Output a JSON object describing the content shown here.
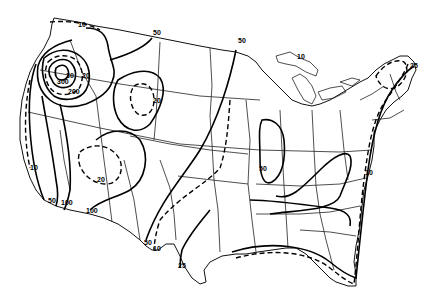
{
  "map": {
    "type": "isoline map",
    "region": "Contiguous United States",
    "line_styles": [
      "solid",
      "dashed"
    ],
    "contour_labels": [
      {
        "id": "nw-10",
        "text": "10",
        "x": 78,
        "y": 27
      },
      {
        "id": "nw-30",
        "text": "30",
        "x": 66,
        "y": 78
      },
      {
        "id": "nw-20",
        "text": "20",
        "x": 82,
        "y": 78
      },
      {
        "id": "nw-300",
        "text": "300",
        "x": 57,
        "y": 84
      },
      {
        "id": "nw-200",
        "text": "200",
        "x": 68,
        "y": 94
      },
      {
        "id": "north-50",
        "text": "50",
        "x": 153,
        "y": 35
      },
      {
        "id": "plains-50",
        "text": "50",
        "x": 238,
        "y": 43
      },
      {
        "id": "great-basin-20",
        "text": "20",
        "x": 153,
        "y": 103
      },
      {
        "id": "west-coast-10",
        "text": "10",
        "x": 30,
        "y": 170
      },
      {
        "id": "sw-20",
        "text": "20",
        "x": 97,
        "y": 182
      },
      {
        "id": "west-coast-50",
        "text": "50",
        "x": 48,
        "y": 203
      },
      {
        "id": "west-coast-100",
        "text": "100",
        "x": 61,
        "y": 205
      },
      {
        "id": "sw-100",
        "text": "100",
        "x": 86,
        "y": 213
      },
      {
        "id": "texas-50",
        "text": "50",
        "x": 144,
        "y": 245
      },
      {
        "id": "texas-10",
        "text": "10",
        "x": 153,
        "y": 251
      },
      {
        "id": "texas-25",
        "text": "25",
        "x": 178,
        "y": 268
      },
      {
        "id": "midwest-50",
        "text": "50",
        "x": 259,
        "y": 171
      },
      {
        "id": "great-lakes-10",
        "text": "10",
        "x": 297,
        "y": 59
      },
      {
        "id": "new-england-25",
        "text": "25",
        "x": 410,
        "y": 68
      },
      {
        "id": "east-coast-10",
        "text": "10",
        "x": 365,
        "y": 175
      }
    ]
  }
}
